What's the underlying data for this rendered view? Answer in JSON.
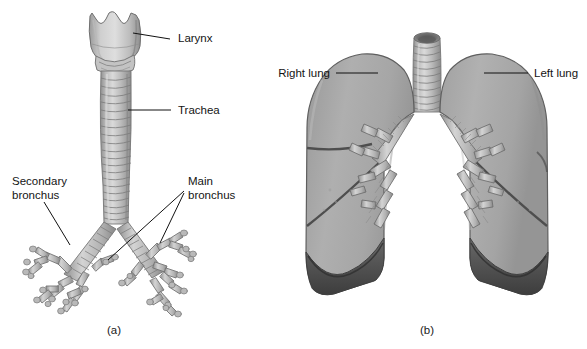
{
  "figure": {
    "background_color": "#ffffff",
    "width": 587,
    "height": 349
  },
  "palette": {
    "ink": "#111111",
    "text": "#141414",
    "tissue_light": "#d2d2d2",
    "tissue_mid": "#b4b4b4",
    "tissue_base": "#a9a9a9",
    "tissue_shade": "#8c8c8c",
    "tissue_dark": "#6e6e6e",
    "cavity_shadow": "#4a4a4a",
    "outline": "#5a5a5a"
  },
  "panels": [
    {
      "id": "a",
      "caption": "(a)",
      "name": "panel-a-airway",
      "labels": [
        {
          "id": "larynx",
          "text": "Larynx",
          "lines": [
            "Larynx"
          ],
          "anchor": "start",
          "text_x": 178,
          "text_y": 42,
          "leader": "M 170 39 L 133 33"
        },
        {
          "id": "trachea",
          "text": "Trachea",
          "lines": [
            "Trachea"
          ],
          "anchor": "start",
          "text_x": 178,
          "text_y": 114,
          "leader": "M 171 110 L 128 110"
        },
        {
          "id": "secondary-bronchus",
          "text": "Secondary bronchus",
          "lines": [
            "Secondary",
            "bronchus"
          ],
          "anchor": "start",
          "text_x": 12,
          "text_y": 185,
          "leader": "M 44 202 L 70 245"
        },
        {
          "id": "main-bronchus",
          "text": "Main bronchus",
          "lines": [
            "Main",
            "bronchus"
          ],
          "anchor": "start",
          "text_x": 188,
          "text_y": 185,
          "leader_1": "M 184 191 L 108 260",
          "leader_2": "M 184 193 L 160 243"
        }
      ],
      "structures": {
        "larynx": "goblet-shaped cartilage with scalloped superior border",
        "trachea": "vertical tube with 20 cartilage rings",
        "carina": "bifurcation into left and right main bronchi",
        "bronchial_tree": "branching secondary and tertiary bronchi terminating in segmented twigs",
        "trachea_ring_count": 20
      }
    },
    {
      "id": "b",
      "caption": "(b)",
      "name": "panel-b-lungs",
      "labels": [
        {
          "id": "right-lung",
          "text": "Right lung",
          "lines": [
            "Right lung"
          ],
          "anchor": "end",
          "text_x": 330,
          "text_y": 77,
          "leader": "M 336 73 L 378 73"
        },
        {
          "id": "left-lung",
          "text": "Left lung",
          "lines": [
            "Left lung"
          ],
          "anchor": "start",
          "text_x": 534,
          "text_y": 77,
          "leader": "M 484 73 L 528 73"
        }
      ],
      "structures": {
        "trachea": "midline trachea with open lumen at top and cartilage rings",
        "right_lung": "three lobes separated by horizontal and oblique fissures",
        "left_lung": "two lobes separated by an oblique fissure",
        "diaphragm_surface": "dark concave shadowed lung bases",
        "hilum": "branching bronchi entering each lung at the root"
      }
    }
  ]
}
